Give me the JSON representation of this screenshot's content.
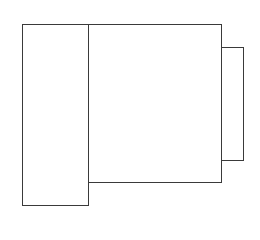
{
  "diagram": {
    "type": "rectangles",
    "stroke_color": "#3a3a3a",
    "background": "#ffffff",
    "shapes": [
      {
        "id": "left-block",
        "x": 22,
        "y": 24,
        "width": 67,
        "height": 182
      },
      {
        "id": "center-block",
        "x": 88,
        "y": 24,
        "width": 134,
        "height": 159
      },
      {
        "id": "right-tab",
        "x": 221,
        "y": 47,
        "width": 23,
        "height": 114
      }
    ]
  }
}
